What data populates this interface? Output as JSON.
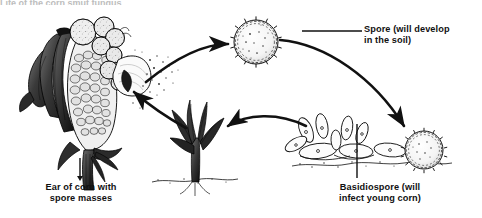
{
  "figure": {
    "title_partial": "Life of the corn smut fungus",
    "background_color": "#ffffff",
    "ink_color": "#111111"
  },
  "labels": {
    "spore": "Spore (will develop\nin the soil)",
    "ear_of_corn": "Ear of corn with\nspore masses",
    "basidiospore": "Basidiospore (will\ninfect young corn)"
  },
  "stages": [
    {
      "id": "ear-of-corn",
      "name": "Ear of corn with spore masses",
      "position": "left"
    },
    {
      "id": "spore-ball",
      "name": "Spore",
      "position": "top-center"
    },
    {
      "id": "basidiospore",
      "name": "Basidiospore",
      "position": "bottom-right"
    },
    {
      "id": "seedling",
      "name": "Young corn seedling",
      "position": "bottom-center"
    }
  ],
  "arrows": [
    {
      "id": "ear-to-spore",
      "from": "ear-of-corn",
      "to": "spore-ball"
    },
    {
      "id": "spore-to-basidiospore",
      "from": "spore-ball",
      "to": "basidiospore"
    },
    {
      "id": "basidiospore-to-seedling",
      "from": "basidiospore",
      "to": "seedling"
    },
    {
      "id": "seedling-to-ear",
      "from": "seedling",
      "to": "ear-of-corn"
    }
  ],
  "leader_lines": [
    {
      "id": "spore-leader",
      "target": "spore-ball"
    },
    {
      "id": "basidiospore-leader",
      "target": "basidiospore"
    },
    {
      "id": "ear-leader",
      "target": "ear-of-corn"
    }
  ]
}
